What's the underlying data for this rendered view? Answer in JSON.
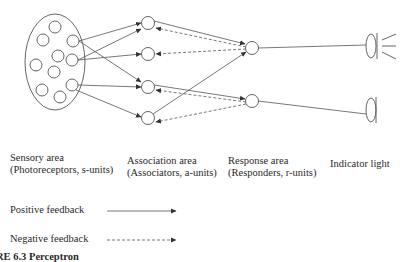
{
  "areas": {
    "sensory": {
      "title": "Sensory area",
      "subtitle": "(Photoreceptors, s-units)"
    },
    "association": {
      "title": "Association area",
      "subtitle": "(Associators, a-units)"
    },
    "response": {
      "title": "Response area",
      "subtitle": "(Responders, r-units)"
    },
    "indicator": {
      "title": "Indicator light"
    }
  },
  "legend": {
    "positive": "Positive feedback",
    "negative": "Negative feedback"
  },
  "caption": "RE 6.3  Perceptron",
  "colors": {
    "line": "#555555",
    "node": "#555555"
  }
}
